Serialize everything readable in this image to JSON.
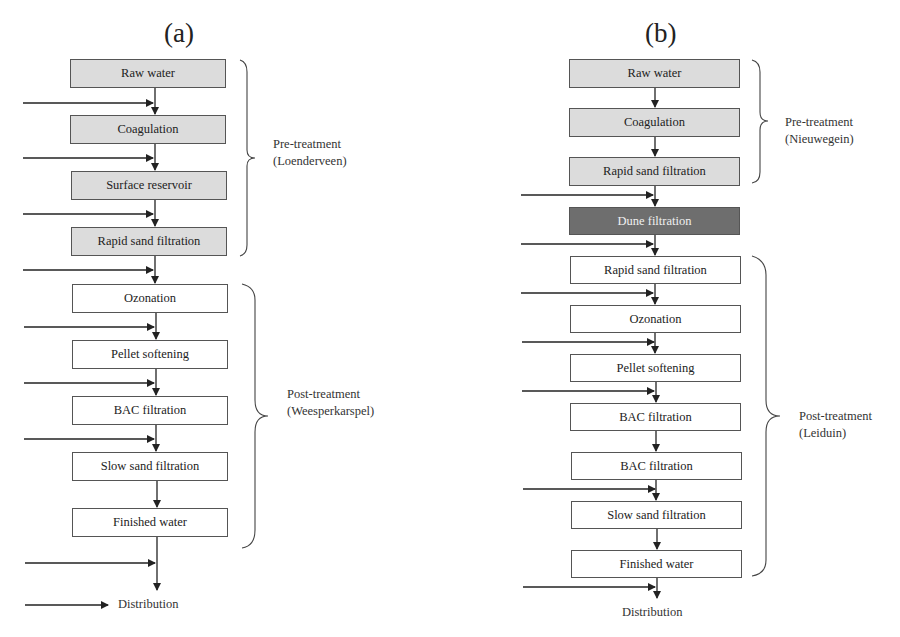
{
  "panels": [
    {
      "label": "(a)",
      "steps": [
        {
          "label": "Raw water",
          "style": "pre"
        },
        {
          "label": "Coagulation",
          "style": "pre"
        },
        {
          "label": "Surface reservoir",
          "style": "pre"
        },
        {
          "label": "Rapid sand filtration",
          "style": "pre"
        },
        {
          "label": "Ozonation",
          "style": "post"
        },
        {
          "label": "Pellet softening",
          "style": "post"
        },
        {
          "label": "BAC filtration",
          "style": "post"
        },
        {
          "label": "Slow sand filtration",
          "style": "post"
        },
        {
          "label": "Finished water",
          "style": "post"
        }
      ],
      "groups": [
        {
          "line1": "Pre-treatment",
          "line2": "(Loenderveen)"
        },
        {
          "line1": "Post-treatment",
          "line2": "(Weesperkarspel)"
        }
      ],
      "distribution": "Distribution"
    },
    {
      "label": "(b)",
      "steps": [
        {
          "label": "Raw water",
          "style": "pre"
        },
        {
          "label": "Coagulation",
          "style": "pre"
        },
        {
          "label": "Rapid sand filtration",
          "style": "pre"
        },
        {
          "label": "Dune filtration",
          "style": "dark"
        },
        {
          "label": "Rapid sand filtration",
          "style": "post"
        },
        {
          "label": "Ozonation",
          "style": "post"
        },
        {
          "label": "Pellet softening",
          "style": "post"
        },
        {
          "label": "BAC filtration",
          "style": "post"
        },
        {
          "label": "BAC filtration",
          "style": "post"
        },
        {
          "label": "Slow sand filtration",
          "style": "post"
        },
        {
          "label": "Finished water",
          "style": "post"
        }
      ],
      "groups": [
        {
          "line1": "Pre-treatment",
          "line2": "(Nieuwegein)"
        },
        {
          "line1": "Post-treatment",
          "line2": "(Leiduin)"
        }
      ],
      "distribution": "Distribution"
    }
  ],
  "colors": {
    "pre_fill": "#dcdcdc",
    "post_fill": "#ffffff",
    "dune_fill": "#6e6e6e",
    "line": "#222222"
  }
}
